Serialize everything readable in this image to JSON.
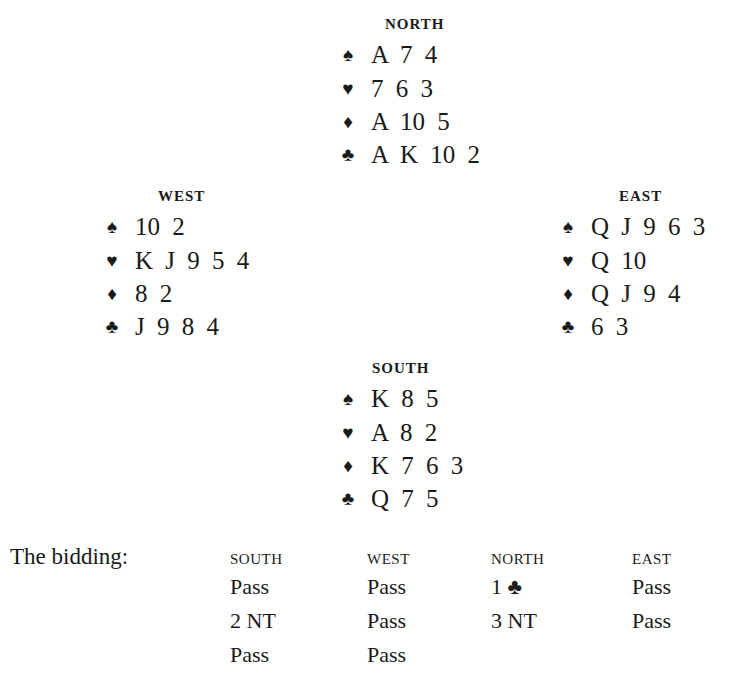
{
  "suits": {
    "spades": "♠",
    "hearts": "♥",
    "diamonds": "♦",
    "clubs": "♣"
  },
  "hands": {
    "north": {
      "title": "NORTH",
      "spades": "A 7 4",
      "hearts": "7 6 3",
      "diamonds": "A 10 5",
      "clubs": "A K 10 2"
    },
    "west": {
      "title": "WEST",
      "spades": "10 2",
      "hearts": "K J 9 5 4",
      "diamonds": "8 2",
      "clubs": "J 9 8 4"
    },
    "east": {
      "title": "EAST",
      "spades": "Q J 9 6 3",
      "hearts": "Q 10",
      "diamonds": "Q J 9 4",
      "clubs": "6 3"
    },
    "south": {
      "title": "SOUTH",
      "spades": "K 8 5",
      "hearts": "A 8 2",
      "diamonds": "K 7 6 3",
      "clubs": "Q 7 5"
    }
  },
  "bidding": {
    "label": "The bidding:",
    "columns": [
      {
        "header": "SOUTH",
        "bids": [
          "Pass",
          "2 NT",
          "Pass"
        ]
      },
      {
        "header": "WEST",
        "bids": [
          "Pass",
          "Pass",
          "Pass"
        ]
      },
      {
        "header": "NORTH",
        "bids": [
          "1 ♣",
          "3 NT"
        ]
      },
      {
        "header": "EAST",
        "bids": [
          "Pass",
          "Pass"
        ]
      }
    ]
  }
}
